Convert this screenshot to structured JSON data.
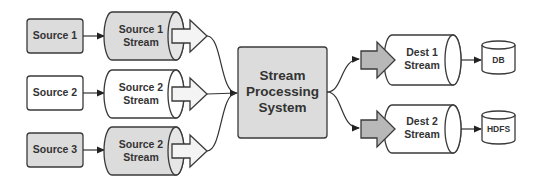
{
  "diagram": {
    "colors": {
      "gray_fill": "#dcdcdc",
      "white_fill": "#ffffff",
      "arrow_gray": "#b8b8b8",
      "arrow_light": "#f4f4f4",
      "stroke": "#3a3a3a"
    },
    "sources": [
      {
        "label": "Source 1",
        "fill": "gray"
      },
      {
        "label": "Source 2",
        "fill": "white"
      },
      {
        "label": "Source 3",
        "fill": "gray"
      }
    ],
    "source_streams": [
      {
        "line1": "Source 1",
        "line2": "Stream",
        "fill": "gray"
      },
      {
        "line1": "Source 2",
        "line2": "Stream",
        "fill": "white"
      },
      {
        "line1": "Source 2",
        "line2": "Stream",
        "fill": "gray"
      }
    ],
    "processor": {
      "line1": "Stream",
      "line2": "Processing",
      "line3": "System"
    },
    "dest_streams": [
      {
        "line1": "Dest 1",
        "line2": "Stream"
      },
      {
        "line1": "Dest 2",
        "line2": "Stream"
      }
    ],
    "sinks": [
      {
        "label": "DB"
      },
      {
        "label": "HDFS"
      }
    ]
  }
}
